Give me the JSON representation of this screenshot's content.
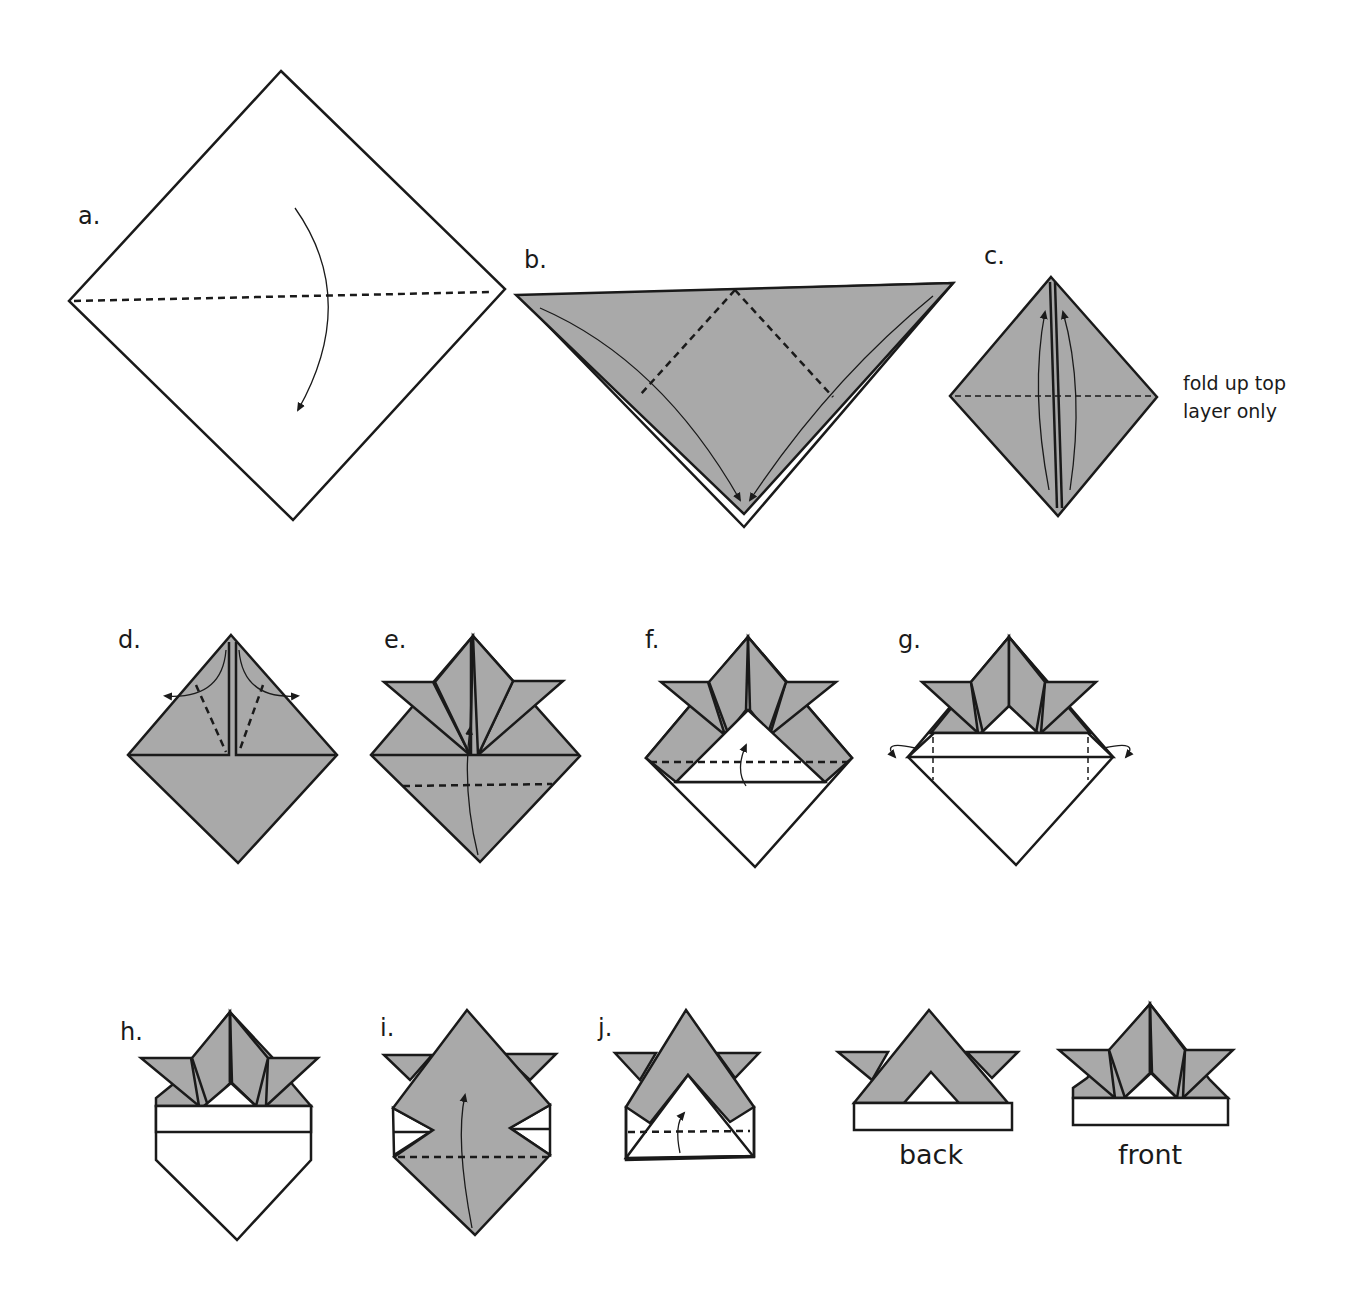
{
  "colors": {
    "paper_colored": "#a9a9a9",
    "paper_white": "#ffffff",
    "line": "#1a1a1a"
  },
  "steps": [
    {
      "id": "a",
      "label": "a."
    },
    {
      "id": "b",
      "label": "b."
    },
    {
      "id": "c",
      "label": "c.",
      "note_lines": [
        "fold up top",
        "layer only"
      ]
    },
    {
      "id": "d",
      "label": "d."
    },
    {
      "id": "e",
      "label": "e."
    },
    {
      "id": "f",
      "label": "f."
    },
    {
      "id": "g",
      "label": "g."
    },
    {
      "id": "h",
      "label": "h."
    },
    {
      "id": "i",
      "label": "i."
    },
    {
      "id": "j",
      "label": "j."
    }
  ],
  "results": [
    {
      "id": "back",
      "caption": "back"
    },
    {
      "id": "front",
      "caption": "front"
    }
  ],
  "legend": {
    "dashed_line": "valley fold",
    "arrow": "fold direction"
  }
}
